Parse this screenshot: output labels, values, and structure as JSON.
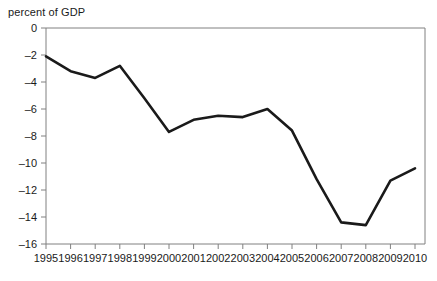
{
  "chart_data": {
    "type": "line",
    "title": "",
    "subtitle": "",
    "ylabel": "percent of GDP",
    "xlabel": "",
    "categories": [
      "1995",
      "1996",
      "1997",
      "1998",
      "1999",
      "2000",
      "2001",
      "2002",
      "2003",
      "2004",
      "2005",
      "2006",
      "2007",
      "2008",
      "2009",
      "2010"
    ],
    "x": [
      1995,
      1996,
      1997,
      1998,
      1999,
      2000,
      2001,
      2002,
      2003,
      2004,
      2005,
      2006,
      2007,
      2008,
      2009,
      2010
    ],
    "values": [
      -2.1,
      -3.2,
      -3.7,
      -2.8,
      -5.2,
      -7.7,
      -6.8,
      -6.5,
      -6.6,
      -6.0,
      -7.6,
      -11.2,
      -14.4,
      -14.6,
      -11.3,
      -10.4
    ],
    "ylim": [
      -16,
      0
    ],
    "xlim": [
      1995,
      2010
    ],
    "yticks": [
      0,
      -2,
      -4,
      -6,
      -8,
      -10,
      -12,
      -14,
      -16
    ],
    "ytick_labels": [
      "0",
      "–2",
      "–4",
      "–6",
      "–8",
      "–10",
      "–12",
      "–14",
      "–16"
    ],
    "xtick_labels": [
      "1995",
      "1996",
      "1997",
      "1998",
      "1999",
      "2000",
      "2001",
      "2002",
      "2003",
      "2004",
      "2005",
      "2006",
      "2007",
      "2008",
      "2009",
      "2010"
    ],
    "grid": false,
    "legend": [],
    "legend_position": "none",
    "series": [
      {
        "name": "percent of GDP",
        "color": "#1a1a1a",
        "values": [
          -2.1,
          -3.2,
          -3.7,
          -2.8,
          -5.2,
          -7.7,
          -6.8,
          -6.5,
          -6.6,
          -6.0,
          -7.6,
          -11.2,
          -14.4,
          -14.6,
          -11.3,
          -10.4
        ]
      }
    ],
    "axis_color": "#808080",
    "line_color": "#1a1a1a",
    "line_width": 2.6,
    "plot_box": {
      "left": 46,
      "right": 425,
      "top": 28,
      "bottom": 244
    }
  }
}
